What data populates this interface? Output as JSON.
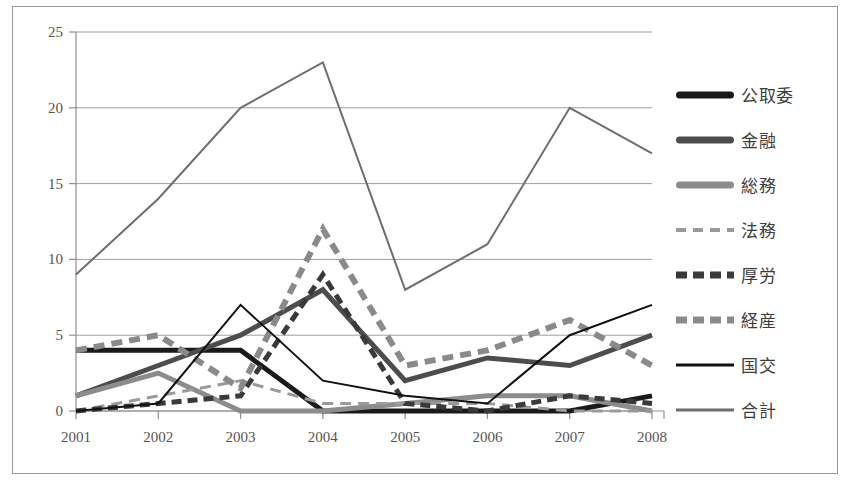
{
  "chart_data": {
    "type": "line",
    "title": "",
    "xlabel": "",
    "ylabel": "",
    "categories": [
      "2001",
      "2002",
      "2003",
      "2004",
      "2005",
      "2006",
      "2007",
      "2008"
    ],
    "ylim": [
      0,
      25
    ],
    "ytick_labels": [
      "0",
      "5",
      "10",
      "15",
      "20",
      "25"
    ],
    "ytick_values": [
      0,
      5,
      10,
      15,
      20,
      25
    ],
    "grid": true,
    "legend_position": "right",
    "series": [
      {
        "name": "公取委",
        "values": [
          4,
          4,
          4,
          0,
          0,
          0,
          0,
          1
        ],
        "color": "#1a1a1a",
        "width": 5,
        "dash": "none"
      },
      {
        "name": "金融",
        "values": [
          1,
          3,
          5,
          8,
          2,
          3.5,
          3,
          5
        ],
        "color": "#4d4d4d",
        "width": 5,
        "dash": "none"
      },
      {
        "name": "総務",
        "values": [
          1,
          2.5,
          0,
          0,
          0.5,
          1,
          1,
          0
        ],
        "color": "#8c8c8c",
        "width": 5,
        "dash": "none"
      },
      {
        "name": "法務",
        "values": [
          0,
          1,
          2,
          0.5,
          0.5,
          0.5,
          0,
          0
        ],
        "color": "#9a9a9a",
        "width": 3,
        "dash": "11,7"
      },
      {
        "name": "厚労",
        "values": [
          0,
          0.5,
          1,
          9,
          0.5,
          0,
          1,
          0.5
        ],
        "color": "#3a3a3a",
        "width": 5,
        "dash": "10,6"
      },
      {
        "name": "経産",
        "values": [
          4,
          5,
          1.5,
          12,
          3,
          4,
          6,
          3
        ],
        "color": "#8a8a8a",
        "width": 6,
        "dash": "11,7"
      },
      {
        "name": "国交",
        "values": [
          0,
          0.5,
          7,
          2,
          1,
          0.5,
          5,
          7
        ],
        "color": "#111111",
        "width": 2,
        "dash": "none"
      },
      {
        "name": "合計",
        "values": [
          9,
          14,
          20,
          23,
          8,
          11,
          20,
          17
        ],
        "color": "#6e6e6e",
        "width": 2,
        "dash": "none"
      }
    ]
  },
  "legend": {
    "items": [
      {
        "label": "公取委",
        "color": "#1a1a1a",
        "height": 7,
        "dash": false
      },
      {
        "label": "金融",
        "color": "#4d4d4d",
        "height": 7,
        "dash": false
      },
      {
        "label": "総務",
        "color": "#8c8c8c",
        "height": 7,
        "dash": false
      },
      {
        "label": "法務",
        "color": "#9a9a9a",
        "height": 4,
        "dash": true
      },
      {
        "label": "厚労",
        "color": "#3a3a3a",
        "height": 7,
        "dash": true
      },
      {
        "label": "経産",
        "color": "#8a8a8a",
        "height": 7,
        "dash": true
      },
      {
        "label": "国交",
        "color": "#111111",
        "height": 3,
        "dash": false
      },
      {
        "label": "合計",
        "color": "#6e6e6e",
        "height": 3,
        "dash": false
      }
    ]
  }
}
